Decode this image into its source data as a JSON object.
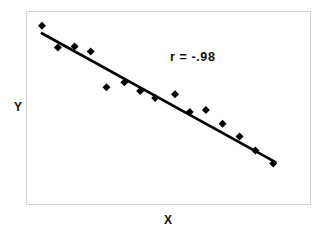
{
  "figure": {
    "background_color": "#ffffff",
    "frame_color": "#d2d2d2",
    "marker_color": "#000000",
    "line_color": "#000000"
  },
  "labels": {
    "y_axis": "Y",
    "x_axis": "X",
    "correlation": "r = -.98"
  },
  "chart_data": {
    "type": "scatter",
    "title": "",
    "xlabel": "X",
    "ylabel": "Y",
    "annotations": [
      {
        "text": "r = -.98",
        "x": 0.52,
        "y": 0.76
      }
    ],
    "grid": false,
    "legend": false,
    "axis_ticks": false,
    "xlim": [
      0,
      1
    ],
    "ylim": [
      0,
      1
    ],
    "correlation": -0.98,
    "marker": "diamond",
    "points": [
      {
        "x": 0.053,
        "y": 0.928
      },
      {
        "x": 0.109,
        "y": 0.815
      },
      {
        "x": 0.168,
        "y": 0.82
      },
      {
        "x": 0.225,
        "y": 0.794
      },
      {
        "x": 0.281,
        "y": 0.608
      },
      {
        "x": 0.344,
        "y": 0.634
      },
      {
        "x": 0.4,
        "y": 0.588
      },
      {
        "x": 0.453,
        "y": 0.552
      },
      {
        "x": 0.523,
        "y": 0.572
      },
      {
        "x": 0.575,
        "y": 0.479
      },
      {
        "x": 0.632,
        "y": 0.49
      },
      {
        "x": 0.691,
        "y": 0.418
      },
      {
        "x": 0.751,
        "y": 0.351
      },
      {
        "x": 0.807,
        "y": 0.278
      },
      {
        "x": 0.87,
        "y": 0.211
      }
    ],
    "fit_line": {
      "label": "regression-line",
      "x_start": 0.049,
      "y_start": 0.892,
      "x_end": 0.881,
      "y_end": 0.216
    }
  }
}
